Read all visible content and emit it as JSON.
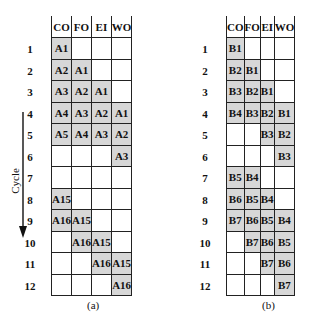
{
  "figure": {
    "y_axis_label": "Cycle",
    "columns": [
      "CO",
      "FO",
      "EI",
      "WO"
    ],
    "rows": [
      "1",
      "2",
      "3",
      "4",
      "5",
      "6",
      "7",
      "8",
      "9",
      "10",
      "11",
      "12"
    ],
    "caption_partial": "Figure 12.10   Two Threads of Execution"
  },
  "panels": [
    {
      "label": "(a)",
      "cells": [
        [
          "A1",
          "",
          "",
          ""
        ],
        [
          "A2",
          "A1",
          "",
          ""
        ],
        [
          "A3",
          "A2",
          "A1",
          ""
        ],
        [
          "A4",
          "A3",
          "A2",
          "A1"
        ],
        [
          "A5",
          "A4",
          "A3",
          "A2"
        ],
        [
          "",
          "",
          "",
          "A3"
        ],
        [
          "",
          "",
          "",
          ""
        ],
        [
          "A15",
          "",
          "",
          ""
        ],
        [
          "A16",
          "A15",
          "",
          ""
        ],
        [
          "",
          "A16",
          "A15",
          ""
        ],
        [
          "",
          "",
          "A16",
          "A15"
        ],
        [
          "",
          "",
          "",
          "A16"
        ]
      ]
    },
    {
      "label": "(b)",
      "cells": [
        [
          "B1",
          "",
          "",
          ""
        ],
        [
          "B2",
          "B1",
          "",
          ""
        ],
        [
          "B3",
          "B2",
          "B1",
          ""
        ],
        [
          "B4",
          "B3",
          "B2",
          "B1"
        ],
        [
          "",
          "",
          "B3",
          "B2"
        ],
        [
          "",
          "",
          "",
          "B3"
        ],
        [
          "B5",
          "B4",
          "",
          ""
        ],
        [
          "B6",
          "B5",
          "B4",
          ""
        ],
        [
          "B7",
          "B6",
          "B5",
          "B4"
        ],
        [
          "",
          "B7",
          "B6",
          "B5"
        ],
        [
          "",
          "",
          "B7",
          "B6"
        ],
        [
          "",
          "",
          "",
          "B7"
        ]
      ]
    }
  ]
}
